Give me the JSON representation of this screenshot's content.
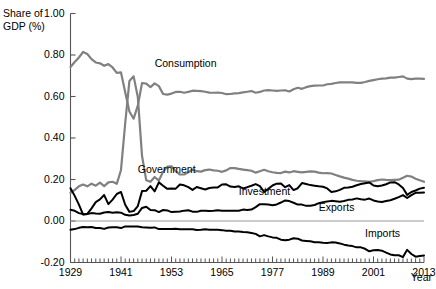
{
  "chart_data": {
    "type": "line",
    "title": "",
    "xlabel": "Year",
    "ylabel": "Share of GDP (%)",
    "ylabel_lines": [
      "Share of",
      "GDP (%)"
    ],
    "xlim": [
      1929,
      2013
    ],
    "ylim": [
      -0.2,
      1.0
    ],
    "grid": false,
    "legend_position": "inline-annotations",
    "ytick_labels": [
      "1.00",
      "0.80",
      "0.60",
      "0.40",
      "0.20",
      "0.00",
      "-0.20"
    ],
    "ytick_values": [
      1.0,
      0.8,
      0.6,
      0.4,
      0.2,
      0.0,
      -0.2
    ],
    "xtick_labels": [
      "1929",
      "1941",
      "1953",
      "1965",
      "1977",
      "1989",
      "2001",
      "2013"
    ],
    "xtick_values": [
      1929,
      1941,
      1953,
      1965,
      1977,
      1989,
      2001,
      2013
    ],
    "xtick_minor_step": 1,
    "zero_line": 0.0,
    "colors": {
      "consumption": "#808080",
      "government": "#808080",
      "investment": "#000000",
      "exports": "#000000",
      "imports": "#000000",
      "axis": "#555555",
      "zero_line": "#999999"
    },
    "x": [
      1929,
      1930,
      1931,
      1932,
      1933,
      1934,
      1935,
      1936,
      1937,
      1938,
      1939,
      1940,
      1941,
      1942,
      1943,
      1944,
      1945,
      1946,
      1947,
      1948,
      1949,
      1950,
      1951,
      1952,
      1953,
      1954,
      1955,
      1956,
      1957,
      1958,
      1959,
      1960,
      1961,
      1962,
      1963,
      1964,
      1965,
      1966,
      1967,
      1968,
      1969,
      1970,
      1971,
      1972,
      1973,
      1974,
      1975,
      1976,
      1977,
      1978,
      1979,
      1980,
      1981,
      1982,
      1983,
      1984,
      1985,
      1986,
      1987,
      1988,
      1989,
      1990,
      1991,
      1992,
      1993,
      1994,
      1995,
      1996,
      1997,
      1998,
      1999,
      2000,
      2001,
      2002,
      2003,
      2004,
      2005,
      2006,
      2007,
      2008,
      2009,
      2010,
      2011,
      2012,
      2013
    ],
    "series": [
      {
        "name": "Consumption",
        "color": "#808080",
        "label_x": 1949,
        "label_y": 0.755,
        "values": [
          0.742,
          0.766,
          0.788,
          0.815,
          0.805,
          0.78,
          0.764,
          0.76,
          0.748,
          0.756,
          0.74,
          0.714,
          0.716,
          0.62,
          0.528,
          0.493,
          0.556,
          0.665,
          0.662,
          0.645,
          0.663,
          0.65,
          0.612,
          0.609,
          0.614,
          0.622,
          0.623,
          0.618,
          0.622,
          0.628,
          0.627,
          0.626,
          0.623,
          0.619,
          0.618,
          0.619,
          0.617,
          0.611,
          0.612,
          0.615,
          0.616,
          0.62,
          0.623,
          0.626,
          0.618,
          0.622,
          0.629,
          0.631,
          0.629,
          0.627,
          0.629,
          0.63,
          0.624,
          0.635,
          0.642,
          0.637,
          0.645,
          0.65,
          0.652,
          0.653,
          0.653,
          0.659,
          0.661,
          0.665,
          0.668,
          0.668,
          0.668,
          0.668,
          0.666,
          0.666,
          0.67,
          0.675,
          0.679,
          0.683,
          0.686,
          0.687,
          0.691,
          0.691,
          0.694,
          0.697,
          0.686,
          0.684,
          0.686,
          0.686,
          0.685
        ]
      },
      {
        "name": "Government",
        "color": "#808080",
        "label_x": 1945,
        "label_y": 0.245,
        "values": [
          0.135,
          0.15,
          0.167,
          0.176,
          0.167,
          0.18,
          0.17,
          0.185,
          0.168,
          0.186,
          0.189,
          0.179,
          0.246,
          0.471,
          0.675,
          0.697,
          0.597,
          0.313,
          0.196,
          0.189,
          0.212,
          0.195,
          0.237,
          0.262,
          0.264,
          0.24,
          0.224,
          0.224,
          0.235,
          0.248,
          0.24,
          0.238,
          0.245,
          0.248,
          0.244,
          0.242,
          0.237,
          0.244,
          0.255,
          0.255,
          0.251,
          0.248,
          0.245,
          0.242,
          0.233,
          0.24,
          0.247,
          0.24,
          0.235,
          0.232,
          0.231,
          0.238,
          0.234,
          0.24,
          0.237,
          0.234,
          0.237,
          0.239,
          0.238,
          0.233,
          0.23,
          0.231,
          0.229,
          0.222,
          0.215,
          0.209,
          0.204,
          0.198,
          0.194,
          0.192,
          0.191,
          0.189,
          0.192,
          0.197,
          0.2,
          0.198,
          0.197,
          0.198,
          0.199,
          0.208,
          0.218,
          0.214,
          0.204,
          0.196,
          0.189
        ]
      },
      {
        "name": "Investment",
        "color": "#000000",
        "label_x": 1969,
        "label_y": 0.142,
        "values": [
          0.158,
          0.121,
          0.079,
          0.031,
          0.034,
          0.061,
          0.091,
          0.104,
          0.125,
          0.081,
          0.103,
          0.13,
          0.14,
          0.078,
          0.044,
          0.048,
          0.072,
          0.144,
          0.146,
          0.168,
          0.143,
          0.186,
          0.17,
          0.155,
          0.157,
          0.156,
          0.176,
          0.172,
          0.163,
          0.15,
          0.164,
          0.158,
          0.152,
          0.159,
          0.161,
          0.162,
          0.176,
          0.177,
          0.166,
          0.164,
          0.167,
          0.157,
          0.163,
          0.17,
          0.178,
          0.168,
          0.14,
          0.155,
          0.171,
          0.18,
          0.181,
          0.163,
          0.173,
          0.149,
          0.158,
          0.183,
          0.178,
          0.173,
          0.17,
          0.167,
          0.165,
          0.157,
          0.14,
          0.143,
          0.15,
          0.16,
          0.161,
          0.165,
          0.172,
          0.178,
          0.182,
          0.186,
          0.171,
          0.168,
          0.171,
          0.177,
          0.186,
          0.187,
          0.176,
          0.159,
          0.126,
          0.14,
          0.147,
          0.156,
          0.16
        ]
      },
      {
        "name": "Exports",
        "color": "#000000",
        "label_x": 1988,
        "label_y": 0.062,
        "values": [
          0.054,
          0.049,
          0.038,
          0.033,
          0.034,
          0.038,
          0.036,
          0.035,
          0.041,
          0.043,
          0.04,
          0.042,
          0.04,
          0.03,
          0.027,
          0.029,
          0.035,
          0.063,
          0.069,
          0.053,
          0.052,
          0.043,
          0.053,
          0.051,
          0.043,
          0.045,
          0.046,
          0.05,
          0.052,
          0.045,
          0.044,
          0.049,
          0.049,
          0.048,
          0.049,
          0.052,
          0.05,
          0.05,
          0.05,
          0.049,
          0.049,
          0.055,
          0.053,
          0.055,
          0.067,
          0.081,
          0.081,
          0.079,
          0.076,
          0.08,
          0.089,
          0.099,
          0.096,
          0.088,
          0.079,
          0.079,
          0.073,
          0.073,
          0.077,
          0.086,
          0.091,
          0.094,
          0.097,
          0.095,
          0.093,
          0.096,
          0.102,
          0.104,
          0.109,
          0.105,
          0.103,
          0.108,
          0.099,
          0.094,
          0.092,
          0.096,
          0.1,
          0.107,
          0.115,
          0.125,
          0.111,
          0.125,
          0.136,
          0.136,
          0.137
        ]
      },
      {
        "name": "Imports",
        "color": "#000000",
        "label_x": 1999,
        "label_y": -0.062,
        "values": [
          -0.042,
          -0.039,
          -0.033,
          -0.029,
          -0.03,
          -0.029,
          -0.034,
          -0.034,
          -0.038,
          -0.031,
          -0.03,
          -0.03,
          -0.034,
          -0.026,
          -0.026,
          -0.026,
          -0.027,
          -0.03,
          -0.031,
          -0.033,
          -0.031,
          -0.039,
          -0.038,
          -0.038,
          -0.038,
          -0.037,
          -0.04,
          -0.04,
          -0.04,
          -0.04,
          -0.043,
          -0.042,
          -0.04,
          -0.042,
          -0.042,
          -0.042,
          -0.044,
          -0.047,
          -0.047,
          -0.051,
          -0.051,
          -0.053,
          -0.054,
          -0.058,
          -0.062,
          -0.074,
          -0.068,
          -0.074,
          -0.079,
          -0.081,
          -0.09,
          -0.093,
          -0.09,
          -0.083,
          -0.085,
          -0.094,
          -0.096,
          -0.098,
          -0.102,
          -0.103,
          -0.105,
          -0.106,
          -0.103,
          -0.104,
          -0.108,
          -0.114,
          -0.118,
          -0.121,
          -0.127,
          -0.127,
          -0.134,
          -0.146,
          -0.141,
          -0.14,
          -0.143,
          -0.152,
          -0.161,
          -0.165,
          -0.165,
          -0.174,
          -0.139,
          -0.159,
          -0.172,
          -0.169,
          -0.166
        ]
      }
    ]
  }
}
